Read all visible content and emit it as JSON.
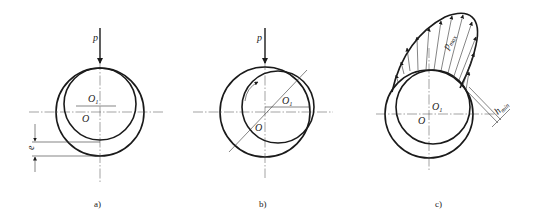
{
  "figure": {
    "panels": [
      {
        "id": "a",
        "caption": "a)",
        "labels": {
          "load": "p",
          "journal_center": "O1",
          "bearing_center": "O",
          "eccentricity": "e"
        }
      },
      {
        "id": "b",
        "caption": "b)",
        "labels": {
          "load": "p",
          "journal_center": "O1",
          "bearing_center": "O"
        }
      },
      {
        "id": "c",
        "caption": "c)",
        "labels": {
          "max_pressure": "p",
          "max_pressure_sub": "max",
          "journal_center": "O1",
          "bearing_center": "O",
          "min_film": "h",
          "min_film_sub": "min"
        }
      }
    ]
  }
}
